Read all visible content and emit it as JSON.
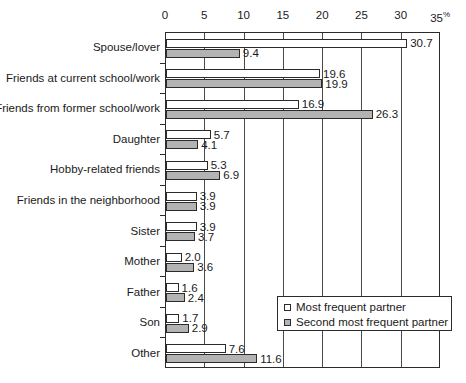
{
  "chart_data": {
    "type": "bar",
    "orientation": "horizontal",
    "title": "",
    "subtitle": "",
    "xlabel": "%",
    "ylabel": "",
    "xlim": [
      0,
      35
    ],
    "xticks": [
      0,
      5,
      10,
      15,
      20,
      25,
      30,
      35
    ],
    "xtick_labels": [
      "0",
      "5",
      "10",
      "15",
      "20",
      "25",
      "30",
      "35"
    ],
    "axis_unit_suffix": "%",
    "grid": true,
    "grid_axis": "x",
    "legend_position": "inside-bottom-right",
    "categories": [
      "Spouse/lover",
      "Friends at current school/work",
      "Friends from former school/work",
      "Daughter",
      "Hobby-related friends",
      "Friends in the neighborhood",
      "Sister",
      "Mother",
      "Father",
      "Son",
      "Other"
    ],
    "series": [
      {
        "name": "Most frequent partner",
        "color": "#ffffff",
        "values": [
          30.7,
          19.6,
          16.9,
          5.7,
          5.3,
          3.9,
          3.9,
          2.0,
          1.6,
          1.7,
          7.6
        ],
        "value_labels": [
          "30.7",
          "19.6",
          "16.9",
          "5.7",
          "5.3",
          "3.9",
          "3.9",
          "2.0",
          "1.6",
          "1.7",
          "7.6"
        ]
      },
      {
        "name": "Second most frequent partner",
        "color": "#b3b3b3",
        "values": [
          9.4,
          19.9,
          26.3,
          4.1,
          6.9,
          3.9,
          3.7,
          3.6,
          2.4,
          2.9,
          11.6
        ],
        "value_labels": [
          "9.4",
          "19.9",
          "26.3",
          "4.1",
          "6.9",
          "3.9",
          "3.7",
          "3.6",
          "2.4",
          "2.9",
          "11.6"
        ]
      }
    ]
  },
  "legend": {
    "items": [
      {
        "label": "Most frequent partner",
        "swatch": "white-square-icon"
      },
      {
        "label": "Second most frequent partner",
        "swatch": "gray-square-icon"
      }
    ]
  }
}
